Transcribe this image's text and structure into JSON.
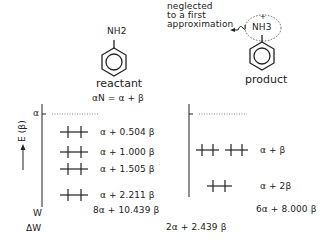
{
  "reactant": {
    "group": "NH2",
    "label": "reactant",
    "alpha_n": "αN = α + β"
  },
  "product": {
    "group": "NH3",
    "charge": "+",
    "label": "product",
    "note_line1": "neglected",
    "note_line2": "to a first",
    "note_line3": "approximation"
  },
  "axis": {
    "label": "E (β)",
    "alpha_tick": "α",
    "w_label": "W",
    "dw_label": "ΔW"
  },
  "reactant_levels": [
    {
      "label": "α + 0.504 β",
      "electrons": 2
    },
    {
      "label": "α + 1.000 β",
      "electrons": 2
    },
    {
      "label": "α + 1.505 β",
      "electrons": 2
    },
    {
      "label": "α + 2.211 β",
      "electrons": 2
    }
  ],
  "product_levels": [
    {
      "label": "α + β",
      "electrons": 4,
      "degenerate": 2
    },
    {
      "label": "α + 2β",
      "electrons": 2,
      "degenerate": 1
    }
  ],
  "totals": {
    "reactant_w": "8α + 10.439 β",
    "product_w": "6α + 8.000 β",
    "delta_w": "2α + 2.439 β"
  }
}
